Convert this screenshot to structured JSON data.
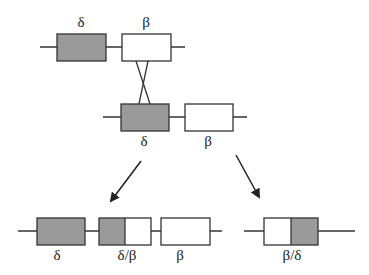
{
  "diagram": {
    "colors": {
      "delta_fill": "#9a9a9a",
      "beta_fill": "#ffffff",
      "stroke": "#333333"
    },
    "top_row": {
      "genes": [
        {
          "label": "δ",
          "type": "delta"
        },
        {
          "label": "β",
          "type": "beta"
        }
      ]
    },
    "middle_row": {
      "genes": [
        {
          "label": "δ",
          "type": "delta"
        },
        {
          "label": "β",
          "type": "beta"
        }
      ]
    },
    "crossover": {
      "description": "crossing lines between β (top) and δ (middle)"
    },
    "products": {
      "left": {
        "genes": [
          {
            "label": "δ",
            "type": "delta"
          },
          {
            "label": "δ/β",
            "type": "fusion-delta-beta"
          },
          {
            "label": "β",
            "type": "beta"
          }
        ]
      },
      "right": {
        "genes": [
          {
            "label": "β/δ",
            "type": "fusion-beta-delta"
          }
        ]
      }
    }
  }
}
